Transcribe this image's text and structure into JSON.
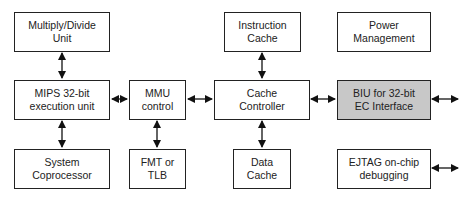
{
  "diagram": {
    "type": "block-diagram",
    "blocks": {
      "multiply_divide": {
        "label": "Multiply/Divide\nUnit"
      },
      "mips_exec": {
        "label": "MIPS 32-bit\nexecution unit"
      },
      "system_coprocessor": {
        "label": "System\nCoprocessor"
      },
      "mmu_control": {
        "label": "MMU\ncontrol"
      },
      "fmt_tlb": {
        "label": "FMT or\nTLB"
      },
      "instruction_cache": {
        "label": "Instruction\nCache"
      },
      "cache_controller": {
        "label": "Cache\nController"
      },
      "data_cache": {
        "label": "Data\nCache"
      },
      "power_management": {
        "label": "Power\nManagement"
      },
      "biu": {
        "label": "BIU for 32-bit\nEC Interface",
        "fill": "#c8c8c8"
      },
      "ejtag": {
        "label": "EJTAG on-chip\ndebugging"
      }
    },
    "connections": [
      {
        "from": "multiply_divide",
        "to": "mips_exec",
        "type": "bidirectional"
      },
      {
        "from": "mips_exec",
        "to": "system_coprocessor",
        "type": "bidirectional"
      },
      {
        "from": "mips_exec",
        "to": "mmu_control",
        "type": "bidirectional"
      },
      {
        "from": "mmu_control",
        "to": "fmt_tlb",
        "type": "bidirectional"
      },
      {
        "from": "mmu_control",
        "to": "cache_controller",
        "type": "bidirectional"
      },
      {
        "from": "instruction_cache",
        "to": "cache_controller",
        "type": "bidirectional"
      },
      {
        "from": "cache_controller",
        "to": "data_cache",
        "type": "bidirectional"
      },
      {
        "from": "cache_controller",
        "to": "biu",
        "type": "bidirectional"
      },
      {
        "from": "biu",
        "to": "external",
        "type": "bidirectional"
      },
      {
        "from": "ejtag",
        "to": "external",
        "type": "bidirectional"
      }
    ]
  }
}
